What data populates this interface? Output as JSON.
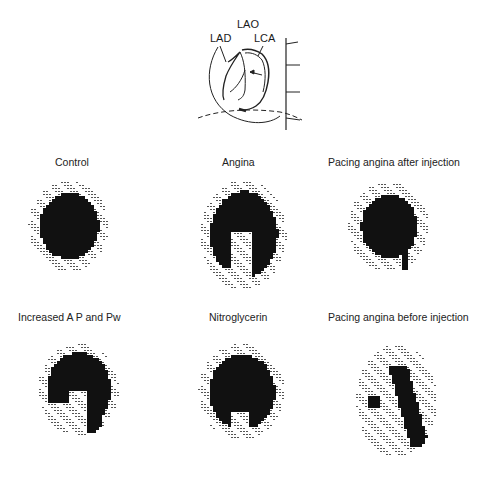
{
  "figure": {
    "diagram": {
      "name": "coronary-anatomy-diagram",
      "view_label": "LAO",
      "labels": [
        "LAD",
        "LCA"
      ]
    },
    "panels": [
      {
        "id": "control",
        "title": "Control",
        "pattern": "control"
      },
      {
        "id": "angina",
        "title": "Angina",
        "pattern": "angina"
      },
      {
        "id": "pacing-after",
        "title": "Pacing angina after injection",
        "pattern": "pacing_after"
      },
      {
        "id": "increased-ap-pw",
        "title": "Increased  A P and Pw",
        "pattern": "increased"
      },
      {
        "id": "nitroglycerin",
        "title": "Nitroglycerin",
        "pattern": "nitro"
      },
      {
        "id": "pacing-before",
        "title": "Pacing angina before injection",
        "pattern": "pacing_before"
      }
    ]
  },
  "colors": {
    "ink": "#111111",
    "halftone": "#555555",
    "background": "#ffffff"
  }
}
